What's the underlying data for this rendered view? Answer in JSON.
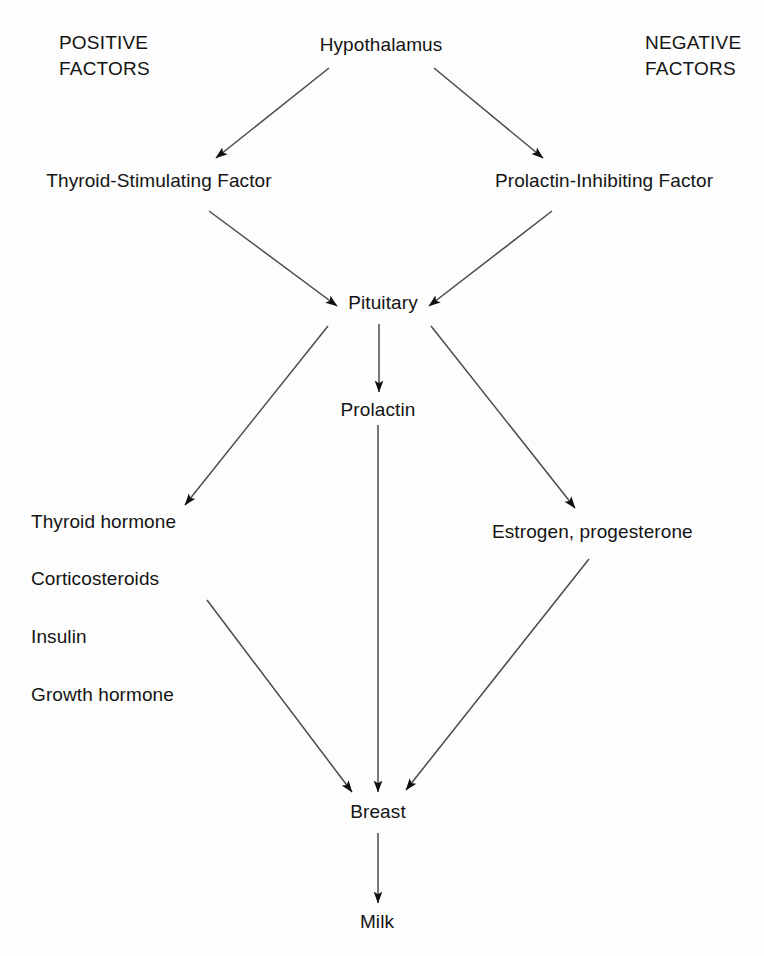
{
  "figure": {
    "type": "flow-diagram",
    "background_color": "#fdfdfd",
    "line_color": "#4a4a4a",
    "text_color": "#141414"
  },
  "headings": {
    "positive": "POSITIVE\nFACTORS",
    "negative": "NEGATIVE\nFACTORS"
  },
  "nodes": {
    "hypothalamus": "Hypothalamus",
    "thyroid_stimulating_factor": "Thyroid-Stimulating Factor",
    "prolactin_inhibiting_factor": "Prolactin-Inhibiting Factor",
    "pituitary": "Pituitary",
    "prolactin": "Prolactin",
    "thyroid_hormone": "Thyroid hormone",
    "corticosteroids": "Corticosteroids",
    "insulin": "Insulin",
    "growth_hormone": "Growth hormone",
    "estrogen_progesterone": "Estrogen, progesterone",
    "breast": "Breast",
    "milk": "Milk"
  },
  "edges": [
    {
      "from": "Hypothalamus",
      "to": "Thyroid-Stimulating Factor",
      "style": "arrow"
    },
    {
      "from": "Hypothalamus",
      "to": "Prolactin-Inhibiting Factor",
      "style": "arrow"
    },
    {
      "from": "Thyroid-Stimulating Factor",
      "to": "Pituitary",
      "style": "arrow"
    },
    {
      "from": "Prolactin-Inhibiting Factor",
      "to": "Pituitary",
      "style": "arrow"
    },
    {
      "from": "Pituitary",
      "to": "Thyroid hormone",
      "style": "arrow"
    },
    {
      "from": "Pituitary",
      "to": "Prolactin",
      "style": "arrow"
    },
    {
      "from": "Pituitary",
      "to": "Estrogen, progesterone",
      "style": "arrow"
    },
    {
      "from": "Thyroid hormone group",
      "to": "Breast",
      "style": "arrow"
    },
    {
      "from": "Prolactin",
      "to": "Breast",
      "style": "arrow"
    },
    {
      "from": "Estrogen, progesterone",
      "to": "Breast",
      "style": "arrow"
    },
    {
      "from": "Breast",
      "to": "Milk",
      "style": "arrow"
    }
  ]
}
